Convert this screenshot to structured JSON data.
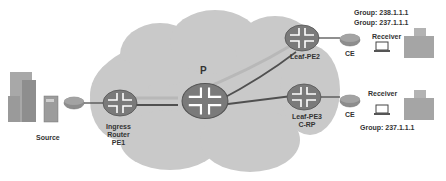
{
  "diagram": {
    "cloud_label": "P",
    "nodes": {
      "source": {
        "label": "Source"
      },
      "ingress": {
        "line1": "Ingress",
        "line2": "Router",
        "line3": "PE1"
      },
      "p_router": {
        "label": ""
      },
      "leaf_pe2": {
        "label": "Leaf-PE2"
      },
      "leaf_pe3": {
        "line1": "Leaf-PE3",
        "line2": "C-RP"
      },
      "ce_top": {
        "label": "CE"
      },
      "ce_bottom": {
        "label": "CE"
      },
      "receiver_top": {
        "label": "Receiver"
      },
      "receiver_bottom": {
        "label": "Receiver"
      }
    },
    "groups": {
      "top_line1": "Group: 238.1.1.1",
      "top_line2": "Group: 237.1.1.1",
      "bottom": "Group: 237.1.1.1"
    },
    "colors": {
      "cloud": "#c8c8c8",
      "router_body": "#7a7a7a",
      "router_arrows": "#ffffff",
      "tunnel_light": "#b0b0b0",
      "tunnel_dark": "#505050",
      "text": "#333333"
    }
  }
}
